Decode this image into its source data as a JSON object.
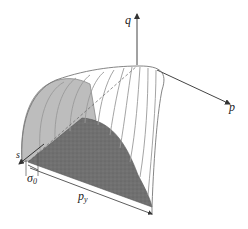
{
  "figure": {
    "top_fragment": "· · · · · ·  · · · · · ·        · · · · ·",
    "axes": {
      "q_label": "q",
      "p_label": "p",
      "s_label": "s"
    },
    "dimensions": {
      "sigma0_label": "σ",
      "sigma0_sub": "0",
      "py_label": "p",
      "py_sub": "y"
    },
    "colors": {
      "line": "#555555",
      "surface_line": "#9a9a9a",
      "shaded_face": "#6e6e6e",
      "light_face": "#bdbdbd"
    }
  }
}
